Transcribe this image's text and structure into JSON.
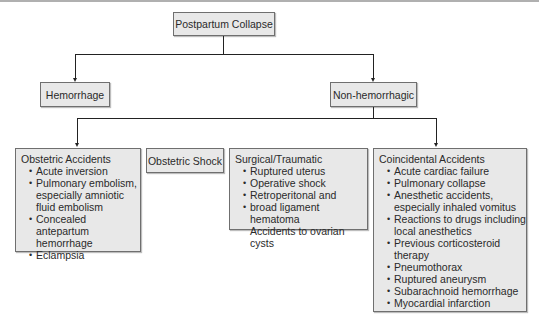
{
  "diagram": {
    "root": {
      "label": "Postpartum Collapse"
    },
    "level1": [
      {
        "label": "Hemorrhage"
      },
      {
        "label": "Non-hemorrhagic"
      }
    ],
    "level2": [
      {
        "title": "Obstetric Accidents",
        "items": [
          "Acute inversion",
          "Pulmonary embolism,",
          "especially amniotic",
          "fluid embolism",
          "Concealed antepartum",
          "hemorrhage",
          "Eclampsia"
        ]
      },
      {
        "title": "Obstetric Shock"
      },
      {
        "title": "Surgical/Traumatic",
        "items": [
          "Ruptured uterus",
          "Operative shock",
          "Retroperitonal and",
          "broad ligament hematoma",
          "Accidents to ovarian cysts"
        ]
      },
      {
        "title": "Coincidental Accidents",
        "items": [
          "Acute cardiac failure",
          "Pulmonary collapse",
          "Anesthetic accidents,",
          "especially inhaled vomitus",
          "Reactions to drugs including",
          "local anesthetics",
          "Previous corticosteroid",
          "therapy",
          "Pneumothorax",
          "Ruptured aneurysm",
          "Subarachnoid hemorrhage",
          "Myocardial  infarction"
        ]
      }
    ]
  }
}
